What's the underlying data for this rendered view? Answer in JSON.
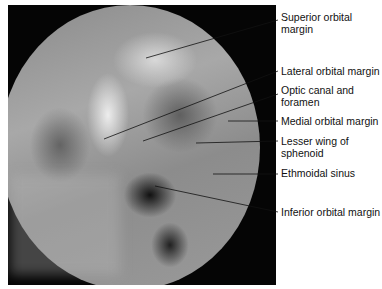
{
  "figure": {
    "type": "radiograph",
    "labels": [
      {
        "id": "superior-orbital-margin",
        "text": "Superior orbital margin",
        "lines": [
          "Superior orbital",
          "margin"
        ]
      },
      {
        "id": "lateral-orbital-margin",
        "text": "Lateral orbital margin",
        "lines": [
          "Lateral orbital margin"
        ]
      },
      {
        "id": "optic-canal-and-foramen",
        "text": "Optic canal and foramen",
        "lines": [
          "Optic canal and",
          "foramen"
        ]
      },
      {
        "id": "medial-orbital-margin",
        "text": "Medial orbital margin",
        "lines": [
          "Medial orbital margin"
        ]
      },
      {
        "id": "lesser-wing-of-sphenoid",
        "text": "Lesser wing of sphenoid",
        "lines": [
          "Lesser wing of",
          "sphenoid"
        ]
      },
      {
        "id": "ethmoidal-sinus",
        "text": "Ethmoidal sinus",
        "lines": [
          "Ethmoidal sinus"
        ]
      },
      {
        "id": "inferior-orbital-margin",
        "text": "Inferior orbital margin",
        "lines": [
          "Inferior orbital margin"
        ]
      }
    ]
  }
}
